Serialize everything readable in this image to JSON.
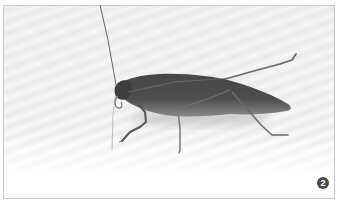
{
  "image": {
    "subject": "katydid insect (side view)",
    "tone": "grayscale",
    "background": "white wavy-patterned surface"
  },
  "badge": {
    "label": "2",
    "color": "#4a4a4a",
    "text_color": "#ffffff"
  },
  "colors": {
    "body": "#4e4e4e",
    "body_dark": "#3c3c3c",
    "legs": "#6a6a6a",
    "frame_border": "#c8c8c8"
  }
}
